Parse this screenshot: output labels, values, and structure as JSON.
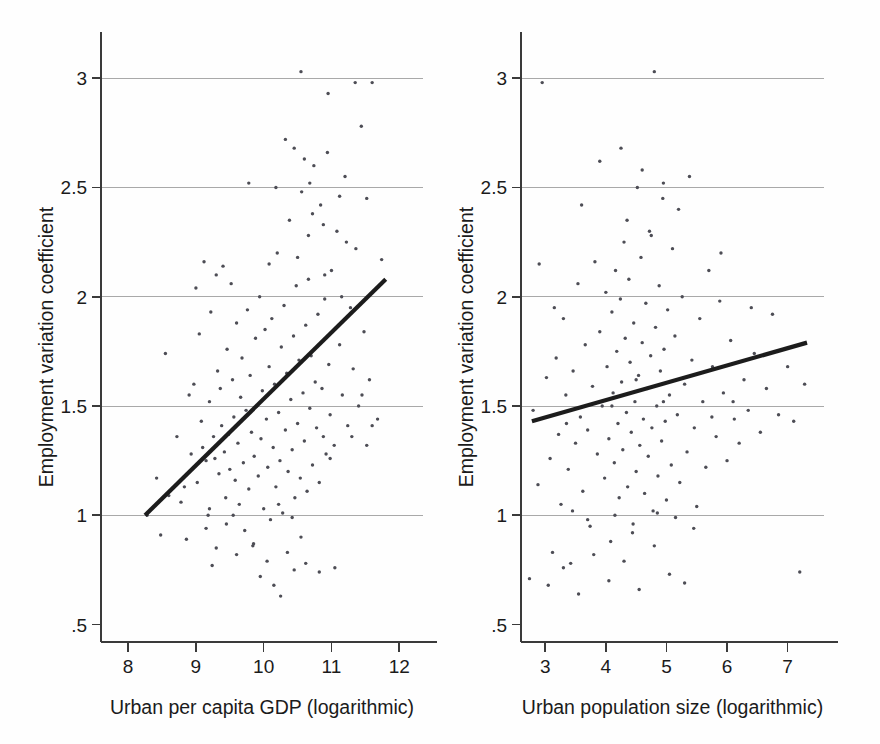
{
  "figure": {
    "background_color": "#fefefe",
    "point_color": "#4d4d55",
    "line_color": "#1c1c1c",
    "grid_color": "#a9a9a9",
    "axis_color": "#3a3a3a"
  },
  "chart_data": [
    {
      "type": "scatter",
      "panel": "left",
      "title": "",
      "xlabel": "Urban per capita GDP (logarithmic)",
      "ylabel": "Employment variation coefficient",
      "xlim": [
        7.6,
        12.35
      ],
      "ylim": [
        0.42,
        3.12
      ],
      "xticks": [
        8,
        9,
        10,
        11,
        12
      ],
      "xticklabels": [
        "8",
        "9",
        "10",
        "11",
        "12"
      ],
      "yticks": [
        0.5,
        1,
        1.5,
        2,
        2.5,
        3
      ],
      "yticklabels": [
        ".5",
        "1",
        "1.5",
        "2",
        "2.5",
        "3"
      ],
      "grid": "horizontal",
      "gridlines_at": [
        1,
        1.5,
        2,
        2.5,
        3
      ],
      "legend": "none",
      "fit_line": {
        "label": "linear fit",
        "x": [
          8.25,
          11.8
        ],
        "y": [
          1.0,
          2.08
        ]
      },
      "points": [
        [
          8.28,
          1.0
        ],
        [
          8.42,
          1.17
        ],
        [
          8.48,
          0.91
        ],
        [
          8.55,
          1.74
        ],
        [
          8.6,
          1.09
        ],
        [
          8.72,
          1.36
        ],
        [
          8.78,
          1.06
        ],
        [
          8.83,
          1.13
        ],
        [
          8.86,
          0.89
        ],
        [
          8.9,
          1.55
        ],
        [
          8.93,
          1.28
        ],
        [
          8.97,
          1.6
        ],
        [
          9.0,
          2.04
        ],
        [
          9.02,
          1.15
        ],
        [
          9.05,
          1.83
        ],
        [
          9.08,
          1.43
        ],
        [
          9.1,
          1.31
        ],
        [
          9.12,
          2.16
        ],
        [
          9.15,
          1.25
        ],
        [
          9.18,
          1.0
        ],
        [
          9.2,
          1.52
        ],
        [
          9.22,
          1.93
        ],
        [
          9.24,
          0.77
        ],
        [
          9.26,
          1.36
        ],
        [
          9.28,
          1.26
        ],
        [
          9.3,
          2.1
        ],
        [
          9.32,
          1.66
        ],
        [
          9.34,
          1.19
        ],
        [
          9.36,
          1.58
        ],
        [
          9.38,
          1.41
        ],
        [
          9.4,
          2.14
        ],
        [
          9.42,
          1.29
        ],
        [
          9.44,
          1.08
        ],
        [
          9.46,
          1.76
        ],
        [
          9.48,
          1.37
        ],
        [
          9.5,
          1.21
        ],
        [
          9.52,
          2.06
        ],
        [
          9.54,
          1.62
        ],
        [
          9.56,
          1.45
        ],
        [
          9.58,
          1.16
        ],
        [
          9.6,
          1.88
        ],
        [
          9.62,
          1.33
        ],
        [
          9.64,
          1.05
        ],
        [
          9.66,
          1.54
        ],
        [
          9.68,
          1.72
        ],
        [
          9.7,
          1.24
        ],
        [
          9.72,
          0.93
        ],
        [
          9.74,
          1.48
        ],
        [
          9.76,
          1.94
        ],
        [
          9.78,
          1.12
        ],
        [
          9.8,
          1.64
        ],
        [
          9.82,
          1.38
        ],
        [
          9.84,
          0.86
        ],
        [
          9.86,
          1.27
        ],
        [
          9.88,
          1.81
        ],
        [
          9.9,
          1.5
        ],
        [
          9.92,
          1.18
        ],
        [
          9.94,
          2.0
        ],
        [
          9.96,
          1.35
        ],
        [
          9.98,
          1.57
        ],
        [
          10.0,
          1.03
        ],
        [
          10.02,
          1.85
        ],
        [
          10.04,
          1.44
        ],
        [
          10.06,
          1.22
        ],
        [
          10.08,
          1.68
        ],
        [
          10.1,
          0.98
        ],
        [
          10.12,
          1.9
        ],
        [
          10.14,
          1.31
        ],
        [
          10.16,
          1.6
        ],
        [
          10.18,
          1.13
        ],
        [
          10.2,
          2.2
        ],
        [
          10.22,
          1.47
        ],
        [
          10.24,
          1.25
        ],
        [
          10.26,
          1.77
        ],
        [
          10.28,
          1.01
        ],
        [
          10.3,
          1.96
        ],
        [
          10.32,
          1.39
        ],
        [
          10.34,
          1.65
        ],
        [
          10.36,
          1.2
        ],
        [
          10.38,
          2.35
        ],
        [
          10.4,
          1.53
        ],
        [
          10.42,
          1.3
        ],
        [
          10.44,
          1.82
        ],
        [
          10.46,
          1.08
        ],
        [
          10.48,
          2.05
        ],
        [
          10.5,
          1.42
        ],
        [
          10.52,
          1.71
        ],
        [
          10.54,
          1.17
        ],
        [
          10.56,
          2.48
        ],
        [
          10.58,
          1.56
        ],
        [
          10.6,
          1.34
        ],
        [
          10.62,
          1.87
        ],
        [
          10.64,
          1.11
        ],
        [
          10.66,
          2.28
        ],
        [
          10.68,
          1.49
        ],
        [
          10.7,
          1.73
        ],
        [
          10.72,
          1.23
        ],
        [
          10.74,
          2.6
        ],
        [
          10.76,
          1.61
        ],
        [
          10.78,
          1.4
        ],
        [
          10.8,
          1.92
        ],
        [
          10.82,
          1.15
        ],
        [
          10.84,
          2.42
        ],
        [
          10.86,
          1.58
        ],
        [
          10.88,
          1.36
        ],
        [
          10.9,
          1.99
        ],
        [
          10.92,
          1.28
        ],
        [
          10.94,
          2.66
        ],
        [
          10.96,
          1.69
        ],
        [
          10.98,
          1.46
        ],
        [
          11.0,
          2.12
        ],
        [
          11.04,
          1.32
        ],
        [
          11.08,
          2.3
        ],
        [
          11.12,
          1.78
        ],
        [
          11.16,
          1.55
        ],
        [
          11.2,
          2.55
        ],
        [
          11.24,
          1.41
        ],
        [
          11.28,
          1.95
        ],
        [
          11.32,
          1.67
        ],
        [
          11.36,
          2.22
        ],
        [
          11.4,
          1.5
        ],
        [
          11.44,
          2.78
        ],
        [
          11.48,
          1.84
        ],
        [
          11.52,
          2.45
        ],
        [
          11.56,
          1.62
        ],
        [
          11.6,
          2.98
        ],
        [
          11.68,
          1.44
        ],
        [
          11.74,
          2.17
        ],
        [
          9.95,
          0.72
        ],
        [
          10.05,
          0.79
        ],
        [
          10.15,
          0.68
        ],
        [
          10.25,
          0.63
        ],
        [
          10.35,
          0.83
        ],
        [
          9.85,
          0.87
        ],
        [
          10.45,
          0.75
        ],
        [
          10.55,
          0.9
        ],
        [
          10.62,
          0.78
        ],
        [
          10.82,
          0.74
        ],
        [
          11.05,
          0.76
        ],
        [
          9.6,
          0.82
        ],
        [
          9.45,
          0.96
        ],
        [
          9.3,
          0.85
        ],
        [
          9.15,
          0.94
        ],
        [
          10.68,
          2.52
        ],
        [
          10.55,
          3.03
        ],
        [
          10.95,
          2.93
        ],
        [
          11.35,
          2.98
        ],
        [
          10.45,
          2.68
        ],
        [
          10.6,
          2.63
        ],
        [
          10.72,
          2.38
        ],
        [
          10.88,
          2.33
        ],
        [
          11.12,
          2.46
        ],
        [
          11.22,
          2.25
        ],
        [
          10.32,
          2.72
        ],
        [
          10.18,
          2.5
        ],
        [
          9.78,
          2.52
        ],
        [
          10.08,
          2.15
        ],
        [
          10.5,
          2.18
        ],
        [
          10.66,
          2.08
        ],
        [
          10.9,
          2.1
        ],
        [
          11.15,
          2.0
        ],
        [
          10.22,
          1.05
        ],
        [
          10.42,
          0.99
        ],
        [
          9.55,
          1.0
        ],
        [
          9.2,
          1.03
        ],
        [
          11.45,
          1.55
        ],
        [
          11.6,
          1.41
        ],
        [
          11.3,
          1.36
        ],
        [
          11.52,
          1.32
        ],
        [
          10.98,
          1.26
        ]
      ]
    },
    {
      "type": "scatter",
      "panel": "right",
      "title": "",
      "xlabel": "Urban population size (logarithmic)",
      "ylabel": "Employment variation coefficient",
      "xlim": [
        2.6,
        7.6
      ],
      "ylim": [
        0.42,
        3.12
      ],
      "xticks": [
        3,
        4,
        5,
        6,
        7
      ],
      "xticklabels": [
        "3",
        "4",
        "5",
        "6",
        "7"
      ],
      "yticks": [
        0.5,
        1,
        1.5,
        2,
        2.5,
        3
      ],
      "yticklabels": [
        ".5",
        "1",
        "1.5",
        "2",
        "2.5",
        "3"
      ],
      "grid": "horizontal",
      "gridlines_at": [
        1,
        1.5,
        2,
        2.5,
        3
      ],
      "legend": "none",
      "fit_line": {
        "label": "linear fit",
        "x": [
          2.78,
          7.32
        ],
        "y": [
          1.43,
          1.79
        ]
      },
      "points": [
        [
          2.74,
          0.71
        ],
        [
          2.8,
          1.48
        ],
        [
          2.88,
          1.14
        ],
        [
          2.95,
          2.98
        ],
        [
          3.02,
          1.63
        ],
        [
          3.08,
          1.26
        ],
        [
          3.12,
          0.83
        ],
        [
          3.18,
          1.72
        ],
        [
          3.22,
          1.37
        ],
        [
          3.26,
          1.05
        ],
        [
          3.3,
          1.9
        ],
        [
          3.34,
          1.55
        ],
        [
          3.38,
          1.21
        ],
        [
          3.42,
          0.78
        ],
        [
          3.46,
          1.66
        ],
        [
          3.5,
          1.33
        ],
        [
          3.54,
          2.06
        ],
        [
          3.58,
          1.45
        ],
        [
          3.62,
          1.11
        ],
        [
          3.66,
          1.78
        ],
        [
          3.7,
          1.39
        ],
        [
          3.74,
          0.95
        ],
        [
          3.78,
          1.59
        ],
        [
          3.82,
          2.16
        ],
        [
          3.86,
          1.28
        ],
        [
          3.9,
          1.84
        ],
        [
          3.94,
          1.5
        ],
        [
          3.98,
          1.17
        ],
        [
          4.0,
          2.02
        ],
        [
          4.02,
          1.68
        ],
        [
          4.05,
          1.35
        ],
        [
          4.08,
          0.88
        ],
        [
          4.1,
          1.93
        ],
        [
          4.12,
          1.56
        ],
        [
          4.14,
          1.24
        ],
        [
          4.16,
          2.12
        ],
        [
          4.18,
          1.75
        ],
        [
          4.2,
          1.42
        ],
        [
          4.22,
          1.08
        ],
        [
          4.24,
          1.99
        ],
        [
          4.26,
          1.61
        ],
        [
          4.28,
          1.3
        ],
        [
          4.3,
          2.25
        ],
        [
          4.32,
          1.81
        ],
        [
          4.34,
          1.47
        ],
        [
          4.36,
          1.13
        ],
        [
          4.38,
          2.08
        ],
        [
          4.4,
          1.7
        ],
        [
          4.42,
          1.38
        ],
        [
          4.44,
          0.92
        ],
        [
          4.46,
          1.88
        ],
        [
          4.48,
          1.52
        ],
        [
          4.5,
          1.2
        ],
        [
          4.52,
          2.5
        ],
        [
          4.54,
          1.64
        ],
        [
          4.56,
          1.32
        ],
        [
          4.58,
          2.18
        ],
        [
          4.6,
          1.79
        ],
        [
          4.62,
          1.44
        ],
        [
          4.64,
          1.1
        ],
        [
          4.66,
          1.97
        ],
        [
          4.68,
          1.58
        ],
        [
          4.7,
          1.27
        ],
        [
          4.72,
          2.3
        ],
        [
          4.74,
          1.73
        ],
        [
          4.76,
          1.4
        ],
        [
          4.78,
          1.02
        ],
        [
          4.8,
          3.03
        ],
        [
          4.82,
          1.86
        ],
        [
          4.84,
          1.5
        ],
        [
          4.86,
          1.18
        ],
        [
          4.88,
          2.05
        ],
        [
          4.9,
          1.66
        ],
        [
          4.92,
          1.34
        ],
        [
          4.94,
          2.45
        ],
        [
          4.96,
          1.76
        ],
        [
          4.98,
          1.43
        ],
        [
          5.0,
          1.07
        ],
        [
          5.02,
          1.94
        ],
        [
          5.05,
          1.55
        ],
        [
          5.08,
          1.23
        ],
        [
          5.1,
          2.22
        ],
        [
          5.14,
          1.82
        ],
        [
          5.18,
          1.46
        ],
        [
          5.22,
          1.15
        ],
        [
          5.26,
          2.0
        ],
        [
          5.3,
          1.6
        ],
        [
          5.34,
          1.29
        ],
        [
          5.38,
          2.55
        ],
        [
          5.42,
          1.71
        ],
        [
          5.46,
          1.4
        ],
        [
          5.5,
          1.04
        ],
        [
          5.55,
          1.9
        ],
        [
          5.6,
          1.52
        ],
        [
          5.65,
          1.22
        ],
        [
          5.7,
          2.12
        ],
        [
          5.76,
          1.68
        ],
        [
          5.82,
          1.36
        ],
        [
          5.88,
          1.98
        ],
        [
          5.94,
          1.56
        ],
        [
          6.0,
          1.25
        ],
        [
          6.06,
          1.8
        ],
        [
          6.12,
          1.44
        ],
        [
          6.2,
          1.33
        ],
        [
          6.28,
          1.62
        ],
        [
          6.35,
          1.48
        ],
        [
          6.45,
          1.74
        ],
        [
          6.55,
          1.38
        ],
        [
          6.65,
          1.58
        ],
        [
          6.75,
          1.92
        ],
        [
          6.85,
          1.46
        ],
        [
          7.0,
          1.68
        ],
        [
          7.1,
          1.43
        ],
        [
          7.2,
          0.74
        ],
        [
          7.28,
          1.6
        ],
        [
          3.05,
          0.68
        ],
        [
          3.3,
          0.76
        ],
        [
          3.55,
          0.64
        ],
        [
          3.8,
          0.82
        ],
        [
          4.05,
          0.7
        ],
        [
          4.3,
          0.79
        ],
        [
          4.55,
          0.66
        ],
        [
          4.8,
          0.86
        ],
        [
          5.05,
          0.73
        ],
        [
          5.3,
          0.69
        ],
        [
          3.45,
          1.02
        ],
        [
          3.7,
          0.98
        ],
        [
          4.15,
          1.0
        ],
        [
          4.45,
          0.96
        ],
        [
          4.85,
          1.01
        ],
        [
          5.15,
          0.99
        ],
        [
          5.45,
          0.94
        ],
        [
          3.9,
          2.62
        ],
        [
          4.25,
          2.68
        ],
        [
          4.6,
          2.58
        ],
        [
          4.95,
          2.52
        ],
        [
          3.6,
          2.42
        ],
        [
          4.35,
          2.35
        ],
        [
          4.75,
          2.28
        ],
        [
          5.2,
          2.4
        ],
        [
          2.9,
          2.15
        ],
        [
          3.15,
          1.95
        ],
        [
          5.9,
          2.2
        ],
        [
          6.4,
          1.95
        ],
        [
          4.1,
          1.5
        ],
        [
          4.5,
          1.62
        ],
        [
          4.95,
          1.52
        ],
        [
          3.35,
          1.42
        ],
        [
          5.75,
          1.45
        ],
        [
          6.1,
          1.52
        ]
      ]
    }
  ]
}
